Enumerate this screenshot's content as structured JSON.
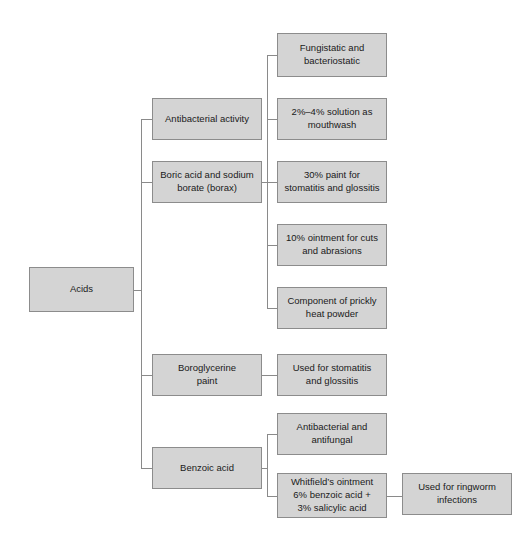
{
  "diagram": {
    "type": "flowchart",
    "background_color": "#ffffff",
    "node_fill_color": "#d4d4d4",
    "node_border_color": "#8c8c8c",
    "connector_color": "#8a8a8a",
    "nodes": [
      {
        "id": "acids",
        "label": "Acids",
        "x": 29,
        "y": 267,
        "w": 105,
        "h": 45,
        "level": 0
      },
      {
        "id": "antibacterial-activity",
        "label": "Antibacterial activity",
        "x": 152,
        "y": 98,
        "w": 110,
        "h": 42,
        "level": 1
      },
      {
        "id": "boric-acid-sodium-borate",
        "label": "Boric acid and sodium\nborate (borax)",
        "x": 152,
        "y": 161,
        "w": 110,
        "h": 42,
        "level": 1
      },
      {
        "id": "boroglycerine-paint",
        "label": "Boroglycerine\npaint",
        "x": 152,
        "y": 354,
        "w": 110,
        "h": 42,
        "level": 1
      },
      {
        "id": "benzoic-acid",
        "label": "Benzoic acid",
        "x": 152,
        "y": 447,
        "w": 110,
        "h": 42,
        "level": 1
      },
      {
        "id": "fungistatic-bacteriostatic",
        "label": "Fungistatic and\nbacteriostatic",
        "x": 277,
        "y": 33,
        "w": 110,
        "h": 44,
        "level": 2
      },
      {
        "id": "solution-mouthwash",
        "label": "2%–4% solution as\nmouthwash",
        "x": 277,
        "y": 98,
        "w": 110,
        "h": 42,
        "level": 2
      },
      {
        "id": "paint-stomatitis-glossitis",
        "label": "30% paint for\nstomatitis and glossitis",
        "x": 277,
        "y": 161,
        "w": 110,
        "h": 42,
        "level": 2
      },
      {
        "id": "ointment-cuts-abrasions",
        "label": "10% ointment for cuts\nand abrasions",
        "x": 277,
        "y": 224,
        "w": 110,
        "h": 42,
        "level": 2
      },
      {
        "id": "prickly-heat-powder",
        "label": "Component of prickly\nheat powder",
        "x": 277,
        "y": 287,
        "w": 110,
        "h": 42,
        "level": 2
      },
      {
        "id": "used-stomatitis-glossitis",
        "label": "Used for stomatitis\nand glossitis",
        "x": 277,
        "y": 354,
        "w": 110,
        "h": 42,
        "level": 2
      },
      {
        "id": "antibacterial-antifungal",
        "label": "Antibacterial and\nantifungal",
        "x": 277,
        "y": 413,
        "w": 110,
        "h": 42,
        "level": 2
      },
      {
        "id": "whitfields-ointment",
        "label": "Whitfield’s ointment\n6% benzoic acid +\n3% salicylic acid",
        "x": 277,
        "y": 473,
        "w": 110,
        "h": 45,
        "level": 2
      },
      {
        "id": "ringworm-infections",
        "label": "Used for ringworm\ninfections",
        "x": 402,
        "y": 473,
        "w": 110,
        "h": 42,
        "level": 3
      }
    ],
    "connectors": [
      {
        "id": "acids-stub",
        "orientation": "h",
        "x": 134,
        "y": 290,
        "length": 8
      },
      {
        "id": "acids-trunk",
        "orientation": "v",
        "x": 141,
        "y": 119,
        "length": 350
      },
      {
        "id": "branch-antibacterial-activity",
        "orientation": "h",
        "x": 141,
        "y": 119,
        "length": 12
      },
      {
        "id": "branch-boric-acid",
        "orientation": "h",
        "x": 141,
        "y": 182,
        "length": 12
      },
      {
        "id": "branch-boroglycerine",
        "orientation": "h",
        "x": 141,
        "y": 375,
        "length": 12
      },
      {
        "id": "branch-benzoic-acid",
        "orientation": "h",
        "x": 141,
        "y": 468,
        "length": 12
      },
      {
        "id": "boric-stub",
        "orientation": "h",
        "x": 262,
        "y": 182,
        "length": 6
      },
      {
        "id": "boric-trunk",
        "orientation": "v",
        "x": 267,
        "y": 55,
        "length": 253
      },
      {
        "id": "branch-fungistatic",
        "orientation": "h",
        "x": 267,
        "y": 55,
        "length": 11
      },
      {
        "id": "branch-mouthwash",
        "orientation": "h",
        "x": 267,
        "y": 119,
        "length": 11
      },
      {
        "id": "branch-30-paint",
        "orientation": "h",
        "x": 267,
        "y": 182,
        "length": 11
      },
      {
        "id": "branch-10-ointment",
        "orientation": "h",
        "x": 267,
        "y": 245,
        "length": 11
      },
      {
        "id": "branch-prickly-heat",
        "orientation": "h",
        "x": 267,
        "y": 308,
        "length": 11
      },
      {
        "id": "boroglycerine-link",
        "orientation": "h",
        "x": 262,
        "y": 375,
        "length": 16
      },
      {
        "id": "benzoic-stub",
        "orientation": "h",
        "x": 262,
        "y": 468,
        "length": 6
      },
      {
        "id": "benzoic-trunk",
        "orientation": "v",
        "x": 267,
        "y": 434,
        "length": 62
      },
      {
        "id": "branch-antibacterial-antifungal",
        "orientation": "h",
        "x": 267,
        "y": 434,
        "length": 11
      },
      {
        "id": "branch-whitfields",
        "orientation": "h",
        "x": 267,
        "y": 496,
        "length": 11
      },
      {
        "id": "whitfields-ringworm-link",
        "orientation": "h",
        "x": 387,
        "y": 496,
        "length": 16
      }
    ]
  }
}
